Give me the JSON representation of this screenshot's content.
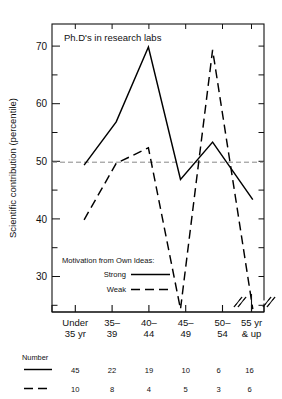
{
  "chart_data": {
    "type": "line",
    "title": "Ph.D's in research labs",
    "xlabel": "",
    "ylabel": "Scientific contribution (percentile)",
    "categories": [
      "Under 35 yr",
      "35-39",
      "40-44",
      "45-49",
      "50-54",
      "55 yr & up"
    ],
    "category_lines": [
      [
        "Under",
        "35 yr"
      ],
      [
        "35–",
        "39"
      ],
      [
        "40–",
        "44"
      ],
      [
        "45–",
        "49"
      ],
      [
        "50–",
        "54"
      ],
      [
        "55 yr",
        "& up"
      ]
    ],
    "ylim": [
      24,
      74
    ],
    "yticks_major": [
      30,
      40,
      50,
      60,
      70
    ],
    "yticks_minor": [
      25,
      35,
      45,
      55,
      65
    ],
    "grid": false,
    "reference_line": {
      "value": 50,
      "style": "dashed",
      "color": "#888888"
    },
    "axis_break": {
      "present": true,
      "between": [
        "50-54",
        "55 yr & up"
      ],
      "symbol": "//"
    },
    "legend": {
      "position": "inside-lower-left",
      "title": "Motivation from Own Ideas:",
      "entries": [
        {
          "label": "Strong",
          "style": "solid"
        },
        {
          "label": "Weak",
          "style": "dashed"
        }
      ]
    },
    "series": [
      {
        "name": "Strong",
        "style": "solid",
        "color": "#000000",
        "values": [
          49.5,
          57.0,
          70.0,
          47.0,
          53.5,
          43.5
        ]
      },
      {
        "name": "Weak",
        "style": "dashed",
        "color": "#000000",
        "values": [
          40.0,
          49.8,
          52.5,
          24.5,
          69.5,
          24.5
        ],
        "clipped_points": [
          "45-49",
          "55 yr & up"
        ]
      }
    ],
    "sample_table": {
      "row_label": "Number",
      "rows": [
        {
          "style": "solid",
          "series": "Strong",
          "counts": [
            45,
            22,
            19,
            10,
            6,
            16
          ]
        },
        {
          "style": "dashed",
          "series": "Weak",
          "counts": [
            10,
            8,
            4,
            5,
            3,
            6
          ]
        }
      ]
    }
  }
}
